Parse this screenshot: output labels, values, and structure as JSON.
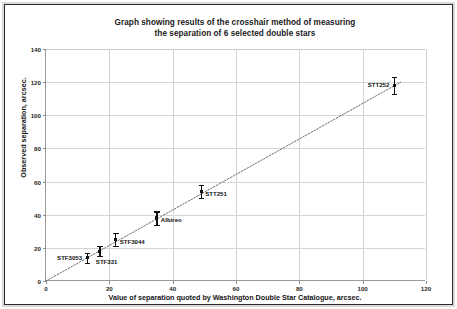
{
  "chart_data": {
    "type": "scatter",
    "title": "Graph showing results of the crosshair method of measuring the separation of 6 selected double stars",
    "title_line1": "Graph showing results of the crosshair method of measuring",
    "title_line2": "the separation of 6 selected double stars",
    "xlabel": "Value of separation quoted by Washington Double Star Catalogue, arcsec.",
    "ylabel": "Observed separation, arcsec.",
    "xlim": [
      0,
      120
    ],
    "ylim": [
      0,
      140
    ],
    "xticks": [
      0,
      20,
      40,
      60,
      80,
      100,
      120
    ],
    "yticks": [
      0,
      20,
      40,
      60,
      80,
      100,
      120,
      140
    ],
    "grid": true,
    "legend": "none",
    "trendline": {
      "style": "dotted",
      "from_x": 0,
      "from_y": 0,
      "to_x": 112,
      "to_y": 120
    },
    "points": [
      {
        "label": "STF3053",
        "x": 13,
        "y": 14,
        "yerr": 3,
        "label_pos": "left"
      },
      {
        "label": "STF331",
        "x": 17,
        "y": 18,
        "yerr": 3,
        "label_pos": "below"
      },
      {
        "label": "STF3044",
        "x": 22,
        "y": 25,
        "yerr": 4,
        "label_pos": "right"
      },
      {
        "label": "Albireo",
        "x": 35,
        "y": 38,
        "yerr": 4,
        "label_pos": "right"
      },
      {
        "label": "STT251",
        "x": 49,
        "y": 54,
        "yerr": 4,
        "label_pos": "right"
      },
      {
        "label": "STT252",
        "x": 110,
        "y": 118,
        "yerr": 5,
        "label_pos": "left"
      }
    ],
    "colors": {
      "marker": "#111111",
      "grid": "#d4d4d4",
      "axis": "#9a9a9a",
      "text": "#1a1a1a",
      "background": "#ffffff"
    }
  }
}
